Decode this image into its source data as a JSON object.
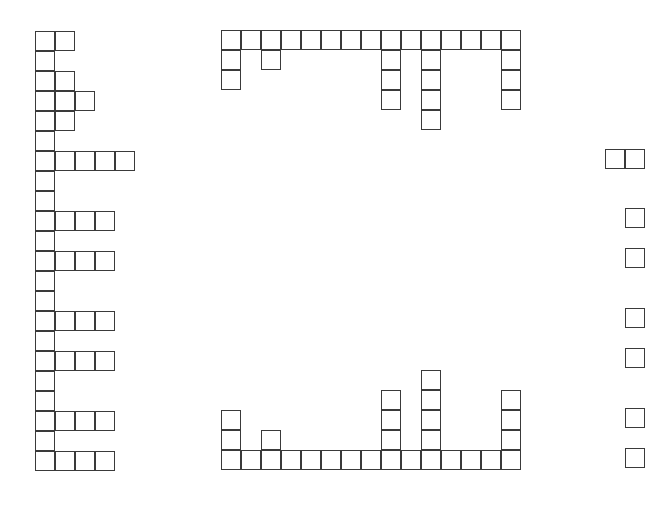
{
  "cell_size": 20,
  "line_color": "#3a3a3a",
  "background": "#ffffff",
  "left_column": {
    "origin": [
      35,
      31
    ],
    "row_lengths": [
      2,
      1,
      2,
      3,
      2,
      1,
      5,
      1,
      1,
      4,
      1,
      4,
      1,
      1,
      4,
      1,
      4,
      1,
      1,
      4,
      1,
      4
    ]
  },
  "middle_top": {
    "origin": [
      221,
      30
    ],
    "column_depths": [
      3,
      1,
      2,
      1,
      1,
      1,
      1,
      1,
      4,
      1,
      5,
      1,
      1,
      1,
      4
    ]
  },
  "middle_bottom": {
    "origin": [
      221,
      450
    ],
    "column_heights": [
      3,
      1,
      2,
      1,
      1,
      1,
      1,
      1,
      4,
      1,
      5,
      1,
      1,
      1,
      4
    ]
  },
  "right_edge": {
    "cells": [
      [
        605,
        149
      ],
      [
        625,
        149
      ],
      [
        625,
        208
      ],
      [
        625,
        248
      ],
      [
        625,
        308
      ],
      [
        625,
        348
      ],
      [
        625,
        408
      ],
      [
        625,
        448
      ]
    ]
  }
}
